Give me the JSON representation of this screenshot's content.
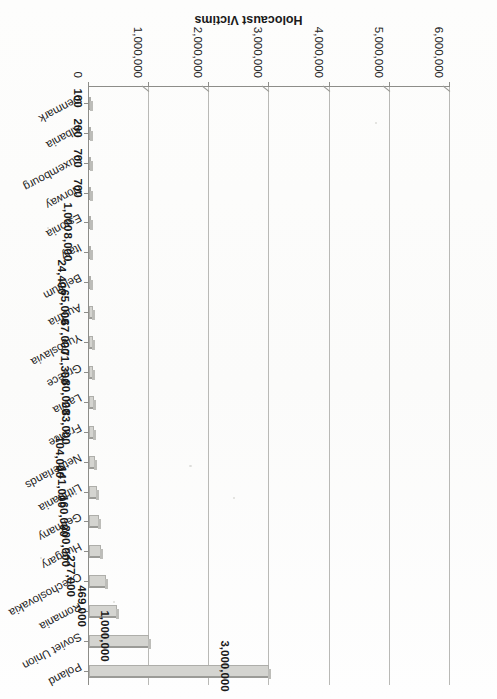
{
  "caption": "Figure 60. Where the Axe Fell in the Holocaust",
  "axis_title": "Holocaust Victims",
  "colors": {
    "bar_fill": "#d4d4d0",
    "bar_top_edge": "#9b9b97",
    "gridline": "#b9b9b6",
    "axis": "#8d8d89",
    "text": "#1a1a1a",
    "paper": "#fdfdfc"
  },
  "value_axis": {
    "ticks": [
      "0",
      "1,000,000",
      "2,000,000",
      "3,000,000",
      "4,000,000",
      "5,000,000",
      "6,000,000"
    ],
    "min": 0,
    "max": 6000000,
    "step": 1000000
  },
  "chart_data": {
    "type": "bar",
    "orientation": "horizontal",
    "title": "Figure 60. Where the Axe Fell in the Holocaust",
    "xlabel": "Holocaust Victims",
    "ylabel": "",
    "xlim": [
      0,
      6000000
    ],
    "grid": true,
    "legend": false,
    "categories": [
      "Poland",
      "Soviet Union",
      "Romania",
      "Czechoslovakia",
      "Hungary",
      "Germany",
      "Lithuania",
      "Netherlands",
      "France",
      "Latvia",
      "Greece",
      "Yugoslavia",
      "Austria",
      "Belgium",
      "Italy",
      "Estonia",
      "Norway",
      "Luxembourg",
      "Albania",
      "Denmark"
    ],
    "values": [
      3000000,
      1000000,
      469000,
      277000,
      200000,
      160000,
      141000,
      104000,
      83000,
      80000,
      71300,
      67000,
      65000,
      24400,
      8000,
      1000,
      700,
      700,
      200,
      100
    ],
    "value_labels": [
      "3,000,000",
      "1,000,000",
      "469,000",
      "277,000",
      "200,000",
      "160,000",
      "141,000",
      "104,000",
      "83,000",
      "80,000",
      "71,300",
      "67,000",
      "65,000",
      "24,400",
      "8,000",
      "1,000",
      "700",
      "700",
      "200",
      "100"
    ]
  }
}
